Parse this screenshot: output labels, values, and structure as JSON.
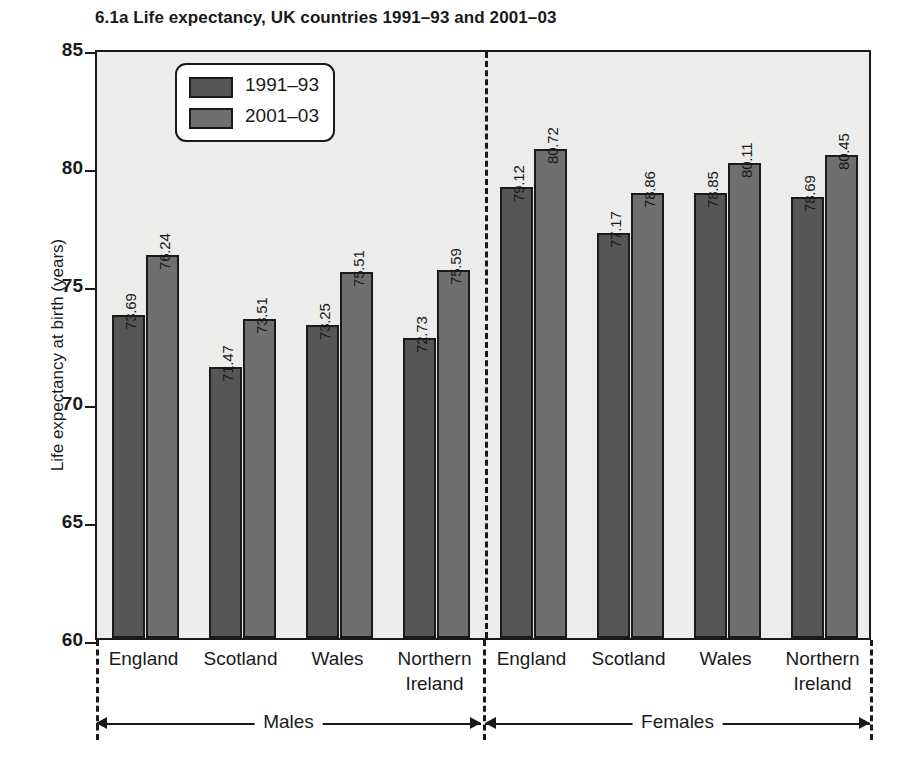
{
  "chart_data": {
    "type": "bar",
    "title": "6.1a  Life expectancy, UK countries 1991–93 and 2001–03",
    "xlabel": "",
    "ylabel": "Life expectancy at birth (years)",
    "ylim": [
      60,
      85
    ],
    "ytick_labels": [
      "85",
      "80",
      "75",
      "70",
      "65",
      "60"
    ],
    "yticks": [
      85,
      80,
      75,
      70,
      65,
      60
    ],
    "grid": false,
    "legend_position": "top-left-inside",
    "categories": [
      "England",
      "Scotland",
      "Wales",
      "Northern Ireland"
    ],
    "groups": [
      "Males",
      "Females"
    ],
    "series": [
      {
        "name": "1991–93",
        "color": "#565656",
        "values_males": [
          73.69,
          71.47,
          73.25,
          72.73
        ],
        "values_females": [
          79.12,
          77.17,
          78.85,
          78.69
        ]
      },
      {
        "name": "2001–03",
        "color": "#6f6f6f",
        "values_males": [
          76.24,
          73.51,
          75.51,
          75.59
        ],
        "values_females": [
          80.72,
          78.86,
          80.11,
          80.45
        ]
      }
    ],
    "bars": [
      {
        "group": "Males",
        "category": "England",
        "series": "1991–93",
        "value": 73.69,
        "label": "73.69"
      },
      {
        "group": "Males",
        "category": "England",
        "series": "2001–03",
        "value": 76.24,
        "label": "76.24"
      },
      {
        "group": "Males",
        "category": "Scotland",
        "series": "1991–93",
        "value": 71.47,
        "label": "71.47"
      },
      {
        "group": "Males",
        "category": "Scotland",
        "series": "2001–03",
        "value": 73.51,
        "label": "73.51"
      },
      {
        "group": "Males",
        "category": "Wales",
        "series": "1991–93",
        "value": 73.25,
        "label": "73.25"
      },
      {
        "group": "Males",
        "category": "Wales",
        "series": "2001–03",
        "value": 75.51,
        "label": "75.51"
      },
      {
        "group": "Males",
        "category": "Northern Ireland",
        "series": "1991–93",
        "value": 72.73,
        "label": "72.73"
      },
      {
        "group": "Males",
        "category": "Northern Ireland",
        "series": "2001–03",
        "value": 75.59,
        "label": "75.59"
      },
      {
        "group": "Females",
        "category": "England",
        "series": "1991–93",
        "value": 79.12,
        "label": "79.12"
      },
      {
        "group": "Females",
        "category": "England",
        "series": "2001–03",
        "value": 80.72,
        "label": "80.72"
      },
      {
        "group": "Females",
        "category": "Scotland",
        "series": "1991–93",
        "value": 77.17,
        "label": "77.17"
      },
      {
        "group": "Females",
        "category": "Scotland",
        "series": "2001–03",
        "value": 78.86,
        "label": "78.86"
      },
      {
        "group": "Females",
        "category": "Wales",
        "series": "1991–93",
        "value": 78.85,
        "label": "78.85"
      },
      {
        "group": "Females",
        "category": "Wales",
        "series": "2001–03",
        "value": 80.11,
        "label": "80.11"
      },
      {
        "group": "Females",
        "category": "Northern Ireland",
        "series": "1991–93",
        "value": 78.69,
        "label": "78.69"
      },
      {
        "group": "Females",
        "category": "Northern Ireland",
        "series": "2001–03",
        "value": 80.45,
        "label": "80.45"
      }
    ]
  },
  "legend": {
    "entries": [
      {
        "label": "1991–93",
        "color": "#565656"
      },
      {
        "label": "2001–03",
        "color": "#6f6f6f"
      }
    ]
  },
  "category_labels": [
    {
      "line1": "England",
      "line2": ""
    },
    {
      "line1": "Scotland",
      "line2": ""
    },
    {
      "line1": "Wales",
      "line2": ""
    },
    {
      "line1": "Northern",
      "line2": "Ireland"
    },
    {
      "line1": "England",
      "line2": ""
    },
    {
      "line1": "Scotland",
      "line2": ""
    },
    {
      "line1": "Wales",
      "line2": ""
    },
    {
      "line1": "Northern",
      "line2": "Ireland"
    }
  ],
  "group_labels": [
    "Males",
    "Females"
  ],
  "colors": {
    "series_1991_93": "#565656",
    "series_2001_03": "#6f6f6f",
    "plot_background": "#ececeb",
    "axis": "#1a1a1a",
    "page_background": "#ffffff"
  }
}
